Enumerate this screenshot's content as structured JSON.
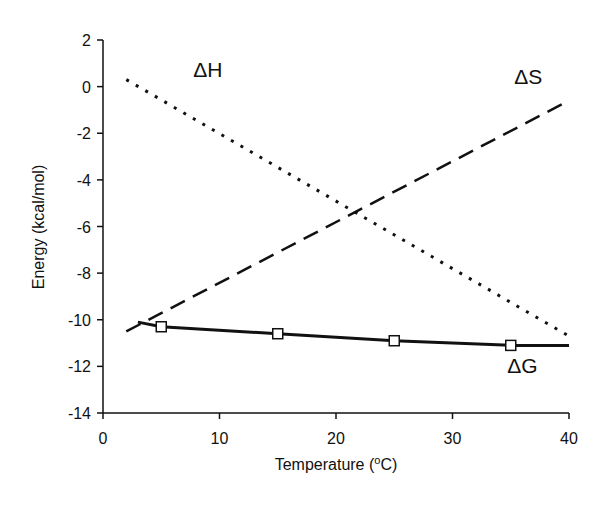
{
  "chart_data": {
    "type": "line",
    "title": "",
    "xlabel": "Temperature (oC)",
    "xlabel_main": "Temperature (",
    "xlabel_sup": "o",
    "xlabel_end": "C)",
    "ylabel": "Energy (kcal/mol)",
    "xlim": [
      0,
      40
    ],
    "ylim": [
      -14,
      2
    ],
    "grid": false,
    "legend": "inline labels",
    "x_ticks": [
      0,
      10,
      20,
      30,
      40
    ],
    "y_ticks": [
      2,
      0,
      -2,
      -4,
      -6,
      -8,
      -10,
      -12,
      -14
    ],
    "series": [
      {
        "name": "ΔH",
        "style": "dotted",
        "x": [
          2,
          40
        ],
        "values": [
          0.3,
          -10.7
        ]
      },
      {
        "name": "ΔS",
        "style": "dashed",
        "x": [
          2,
          40
        ],
        "values": [
          -10.5,
          -0.6
        ]
      },
      {
        "name": "ΔG",
        "style": "solid",
        "x": [
          3,
          5,
          15,
          25,
          35,
          40
        ],
        "values": [
          -10.1,
          -10.3,
          -10.6,
          -10.9,
          -11.1,
          -11.1
        ],
        "markers": {
          "shape": "open-square",
          "x": [
            5,
            15,
            25,
            35
          ],
          "values": [
            -10.3,
            -10.6,
            -10.9,
            -11.1
          ]
        }
      }
    ],
    "annotations": [
      {
        "text": "ΔH",
        "x": 9,
        "y": 0.4
      },
      {
        "text": "ΔS",
        "x": 36.5,
        "y": 0.1
      },
      {
        "text": "ΔG",
        "x": 36,
        "y": -12.3
      }
    ],
    "colors": {
      "line": "#111111",
      "marker_fill": "#ffffff",
      "background": "#ffffff"
    }
  }
}
